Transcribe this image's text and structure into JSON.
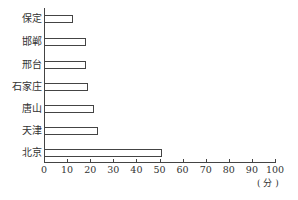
{
  "chart_data": {
    "type": "bar",
    "orientation": "horizontal",
    "title": "",
    "xlabel": "(分)",
    "ylabel": "",
    "categories": [
      "保定",
      "邯郸",
      "邢台",
      "石家庄",
      "唐山",
      "天津",
      "北京"
    ],
    "values": [
      12.5,
      18,
      18,
      19,
      21.7,
      23.4,
      51
    ],
    "xlim": [
      0,
      100
    ],
    "xticks": [
      0,
      10,
      20,
      30,
      40,
      50,
      60,
      70,
      80,
      90,
      100
    ],
    "grid": false,
    "legend": null,
    "bar_fill": "#ffffff",
    "bar_edge": "#444444"
  },
  "labels": {
    "unit": "( 分 )",
    "xticks": [
      "0",
      "10",
      "20",
      "30",
      "40",
      "50",
      "60",
      "70",
      "80",
      "90",
      "100"
    ],
    "categories": [
      "保定",
      "邯郸",
      "邢台",
      "石家庄",
      "唐山",
      "天津",
      "北京"
    ]
  }
}
